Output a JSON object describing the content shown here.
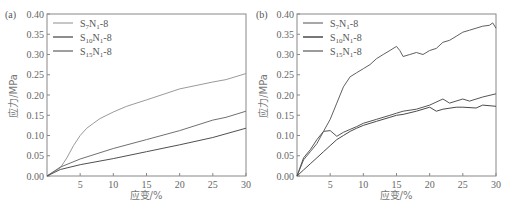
{
  "chart_data": [
    {
      "panel": "(a)",
      "type": "line",
      "title": "",
      "xlabel": "应变/%",
      "ylabel": "应力/MPa",
      "xlim": [
        0,
        30
      ],
      "ylim": [
        0,
        0.4
      ],
      "xticks": [
        5,
        10,
        15,
        20,
        25,
        30
      ],
      "yticks": [
        "0.00",
        "0.05",
        "0.10",
        "0.15",
        "0.20",
        "0.25",
        "0.30",
        "0.35",
        "0.40"
      ],
      "grid": false,
      "legend_position": "upper left",
      "series": [
        {
          "name": "S7N1-8",
          "color": "#9a9a9a",
          "x": [
            0,
            1,
            2,
            3,
            4,
            5,
            6,
            7,
            8,
            10,
            12,
            15,
            20,
            25,
            27,
            30
          ],
          "y": [
            0,
            0.01,
            0.02,
            0.045,
            0.075,
            0.1,
            0.118,
            0.13,
            0.142,
            0.158,
            0.172,
            0.188,
            0.215,
            0.232,
            0.238,
            0.253
          ]
        },
        {
          "name": "S10N1-8",
          "color": "#707070",
          "x": [
            0,
            2,
            5,
            10,
            15,
            20,
            25,
            27,
            30
          ],
          "y": [
            0,
            0.022,
            0.042,
            0.068,
            0.09,
            0.112,
            0.138,
            0.145,
            0.16
          ]
        },
        {
          "name": "S15N1-8",
          "color": "#505050",
          "x": [
            0,
            2,
            5,
            10,
            15,
            20,
            25,
            30
          ],
          "y": [
            0,
            0.016,
            0.028,
            0.043,
            0.06,
            0.077,
            0.095,
            0.118
          ]
        }
      ]
    },
    {
      "panel": "(b)",
      "type": "line",
      "title": "",
      "xlabel": "应变/%",
      "ylabel": "应力/MPa",
      "xlim": [
        0,
        30
      ],
      "ylim": [
        0,
        0.4
      ],
      "xticks": [
        5,
        10,
        15,
        20,
        25,
        30
      ],
      "yticks": [
        "0.00",
        "0.05",
        "0.10",
        "0.15",
        "0.20",
        "0.25",
        "0.30",
        "0.35",
        "0.40"
      ],
      "grid": false,
      "legend_position": "upper left",
      "series": [
        {
          "name": "S7N1-8",
          "color": "#606060",
          "x": [
            0,
            0.5,
            1,
            2,
            3,
            4,
            5,
            6,
            7,
            8,
            9,
            10,
            11,
            12,
            13,
            14,
            15,
            15.5,
            16,
            17,
            18,
            19,
            20,
            21,
            22,
            23,
            24,
            25,
            26,
            27,
            28,
            29,
            29.5,
            30
          ],
          "y": [
            0,
            0.02,
            0.04,
            0.06,
            0.08,
            0.11,
            0.14,
            0.18,
            0.22,
            0.245,
            0.255,
            0.265,
            0.275,
            0.29,
            0.3,
            0.31,
            0.32,
            0.31,
            0.295,
            0.3,
            0.305,
            0.3,
            0.31,
            0.315,
            0.33,
            0.335,
            0.345,
            0.355,
            0.36,
            0.365,
            0.37,
            0.372,
            0.378,
            0.365
          ]
        },
        {
          "name": "S10N1-8",
          "color": "#555555",
          "x": [
            0,
            1,
            2,
            3,
            4,
            5,
            6,
            7,
            8,
            9,
            10,
            12,
            14,
            15,
            16,
            18,
            20,
            22,
            23,
            25,
            26,
            28,
            30
          ],
          "y": [
            0,
            0.045,
            0.065,
            0.09,
            0.11,
            0.112,
            0.098,
            0.108,
            0.115,
            0.122,
            0.13,
            0.14,
            0.15,
            0.155,
            0.16,
            0.165,
            0.175,
            0.19,
            0.18,
            0.19,
            0.185,
            0.195,
            0.203
          ]
        },
        {
          "name": "S15N1-8",
          "color": "#4a4a4a",
          "x": [
            0,
            1,
            2,
            3,
            4,
            5,
            6,
            7,
            8,
            9,
            10,
            12,
            14,
            15,
            16,
            18,
            20,
            21,
            22,
            24,
            25,
            27,
            28,
            30
          ],
          "y": [
            0,
            0.015,
            0.03,
            0.045,
            0.06,
            0.075,
            0.09,
            0.1,
            0.11,
            0.118,
            0.125,
            0.135,
            0.145,
            0.15,
            0.152,
            0.16,
            0.17,
            0.16,
            0.165,
            0.17,
            0.17,
            0.168,
            0.175,
            0.172
          ]
        }
      ]
    }
  ]
}
